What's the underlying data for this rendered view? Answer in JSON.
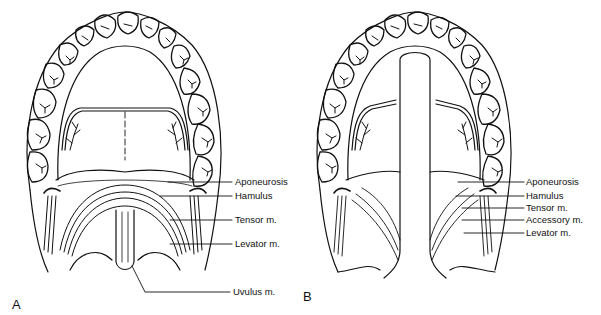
{
  "figure": {
    "panels": [
      {
        "id": "A",
        "letter": "A",
        "labels": [
          {
            "text": "Aponeurosis",
            "x": 235,
            "y": 178
          },
          {
            "text": "Hamulus",
            "x": 235,
            "y": 193
          },
          {
            "text": "Tensor m.",
            "x": 235,
            "y": 217
          },
          {
            "text": "Levator m.",
            "x": 235,
            "y": 241
          },
          {
            "text": "Uvulus m.",
            "x": 233,
            "y": 290
          }
        ]
      },
      {
        "id": "B",
        "letter": "B",
        "labels": [
          {
            "text": "Aponeurosis",
            "x": 526,
            "y": 178
          },
          {
            "text": "Hamulus",
            "x": 526,
            "y": 193
          },
          {
            "text": "Tensor m.",
            "x": 526,
            "y": 205
          },
          {
            "text": "Accessory m.",
            "x": 526,
            "y": 217
          },
          {
            "text": "Levator m.",
            "x": 526,
            "y": 230
          }
        ]
      }
    ]
  }
}
